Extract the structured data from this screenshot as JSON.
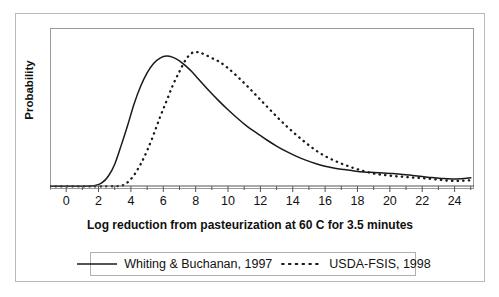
{
  "chart_data": {
    "type": "line",
    "title": "",
    "xlabel": "Log reduction from pasteurization at 60 C for 3.5 minutes",
    "ylabel": "Probability",
    "xlim": [
      -1,
      25.2
    ],
    "ylim": [
      0,
      1.05
    ],
    "grid": false,
    "legend_position": "bottom",
    "xticks": [
      0,
      2,
      4,
      6,
      8,
      10,
      12,
      14,
      16,
      18,
      20,
      22,
      24
    ],
    "xtick_labels": [
      "0",
      "2",
      "4",
      "6",
      "8",
      "10",
      "12",
      "14",
      "16",
      "18",
      "20",
      "22",
      "24"
    ],
    "yticks": [],
    "ytick_labels": [],
    "series": [
      {
        "name": "Whiting & Buchanan, 1997",
        "style": "solid",
        "color": "#1a1a1a",
        "x": [
          -1.0,
          0.0,
          1.0,
          1.8,
          2.2,
          2.6,
          3.0,
          3.4,
          3.8,
          4.2,
          4.6,
          5.0,
          5.4,
          5.8,
          6.2,
          6.6,
          7.0,
          7.4,
          7.8,
          8.2,
          8.8,
          9.4,
          10.0,
          10.6,
          11.2,
          11.8,
          12.4,
          13.0,
          13.6,
          14.2,
          14.8,
          15.4,
          16.0,
          16.6,
          17.2,
          17.8,
          18.4,
          19.0,
          19.6,
          20.2,
          20.8,
          21.4,
          22.0,
          22.6,
          23.2,
          23.8,
          24.4,
          25.0
        ],
        "y": [
          0.005,
          0.005,
          0.006,
          0.012,
          0.03,
          0.08,
          0.17,
          0.31,
          0.46,
          0.62,
          0.75,
          0.85,
          0.92,
          0.96,
          0.975,
          0.965,
          0.94,
          0.9,
          0.855,
          0.8,
          0.72,
          0.645,
          0.575,
          0.51,
          0.45,
          0.4,
          0.35,
          0.305,
          0.265,
          0.23,
          0.2,
          0.175,
          0.155,
          0.14,
          0.13,
          0.12,
          0.112,
          0.108,
          0.104,
          0.1,
          0.094,
          0.086,
          0.078,
          0.07,
          0.064,
          0.06,
          0.062,
          0.068
        ]
      },
      {
        "name": "USDA-FSIS, 1998",
        "style": "dotted",
        "color": "#1a1a1a",
        "x": [
          -1.0,
          1.0,
          2.5,
          3.4,
          3.8,
          4.2,
          4.6,
          5.0,
          5.4,
          5.8,
          6.2,
          6.6,
          7.0,
          7.4,
          7.8,
          8.1,
          8.5,
          9.0,
          9.5,
          10.0,
          10.6,
          11.2,
          11.8,
          12.4,
          13.0,
          13.6,
          14.2,
          14.8,
          15.4,
          16.0,
          16.6,
          17.2,
          17.8,
          18.4,
          19.0,
          19.6,
          20.2,
          20.8,
          21.4,
          22.0,
          22.6,
          23.2,
          23.8,
          24.4,
          25.0
        ],
        "y": [
          0.004,
          0.004,
          0.005,
          0.01,
          0.035,
          0.09,
          0.17,
          0.27,
          0.39,
          0.52,
          0.64,
          0.76,
          0.86,
          0.95,
          1.0,
          1.005,
          0.99,
          0.96,
          0.93,
          0.885,
          0.82,
          0.75,
          0.675,
          0.6,
          0.525,
          0.455,
          0.39,
          0.33,
          0.275,
          0.23,
          0.195,
          0.165,
          0.14,
          0.118,
          0.1,
          0.09,
          0.082,
          0.076,
          0.07,
          0.066,
          0.06,
          0.052,
          0.046,
          0.046,
          0.05
        ]
      }
    ]
  },
  "legend": {
    "entries": [
      {
        "label": "Whiting & Buchanan, 1997",
        "style": "solid"
      },
      {
        "label": "USDA-FSIS, 1998",
        "style": "dotted"
      }
    ]
  }
}
